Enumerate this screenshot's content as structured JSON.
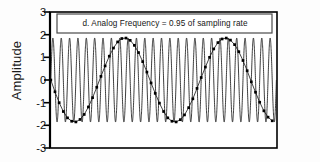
{
  "chart_data": {
    "type": "line",
    "title": "d. Analog Frequency = 0.95 of sampling rate",
    "xlabel": "",
    "ylabel": "Amplitude",
    "ylim": [
      -3,
      3
    ],
    "yticks": [
      3,
      2,
      1,
      0,
      -1,
      -2,
      -3
    ],
    "ytick_labels": [
      "3",
      "2",
      "1",
      "0",
      "-1",
      "-2",
      "-3"
    ],
    "xlim": [
      0,
      27
    ],
    "grid": false,
    "legend": "none",
    "series": [
      {
        "name": "analog signal",
        "type": "line",
        "style": "solid-thin-black",
        "amplitude": 1.85,
        "frequency_cycles_across_axis": 27,
        "phase_deg": 0,
        "description": "continuous high-frequency sine wave at 0.95 of the sampling rate"
      },
      {
        "name": "sampled points",
        "type": "scatter-with-connecting-line",
        "style": "black-square-markers",
        "amplitude": 1.85,
        "frequency_cycles_across_axis": 1.35,
        "phase_deg": 0,
        "marker_count": 54,
        "description": "digital samples alias to an apparent frequency of 0.05 of the sampling rate",
        "x": [
          0,
          0.5,
          1,
          1.5,
          2,
          2.5,
          3,
          3.5,
          4,
          4.5,
          5,
          5.5,
          6,
          6.5,
          7,
          7.5,
          8,
          8.5,
          9,
          9.5,
          10,
          10.5,
          11,
          11.5,
          12,
          12.5,
          13,
          13.5,
          14,
          14.5,
          15,
          15.5,
          16,
          16.5,
          17,
          17.5,
          18,
          18.5,
          19,
          19.5,
          20,
          20.5,
          21,
          21.5,
          22,
          22.5,
          23,
          23.5,
          24,
          24.5,
          25,
          25.5,
          26,
          26.5
        ],
        "y": [
          0.0,
          -0.52,
          -1.0,
          -1.39,
          -1.67,
          -1.82,
          -1.85,
          -1.74,
          -1.52,
          -1.19,
          -0.78,
          -0.32,
          0.16,
          0.62,
          1.05,
          1.41,
          1.68,
          1.83,
          1.85,
          1.75,
          1.53,
          1.21,
          0.81,
          0.35,
          -0.13,
          -0.59,
          -1.02,
          -1.39,
          -1.67,
          -1.82,
          -1.85,
          -1.75,
          -1.54,
          -1.22,
          -0.83,
          -0.37,
          0.11,
          0.57,
          1.0,
          1.37,
          1.65,
          1.81,
          1.85,
          1.76,
          1.56,
          1.25,
          0.86,
          0.41,
          -0.08,
          -0.54,
          -0.98,
          -1.36,
          -1.64,
          -1.8
        ]
      }
    ],
    "annotations": [
      {
        "text": "d. Analog Frequency = 0.95 of sampling rate",
        "position": "top-inside-box"
      }
    ],
    "colors": {
      "axis": "#000000",
      "analog_line": "#1a1a1a",
      "sample_marker": "#000000",
      "background": "#fdfdfd",
      "legend_box_border": "#4a4a4a"
    }
  }
}
